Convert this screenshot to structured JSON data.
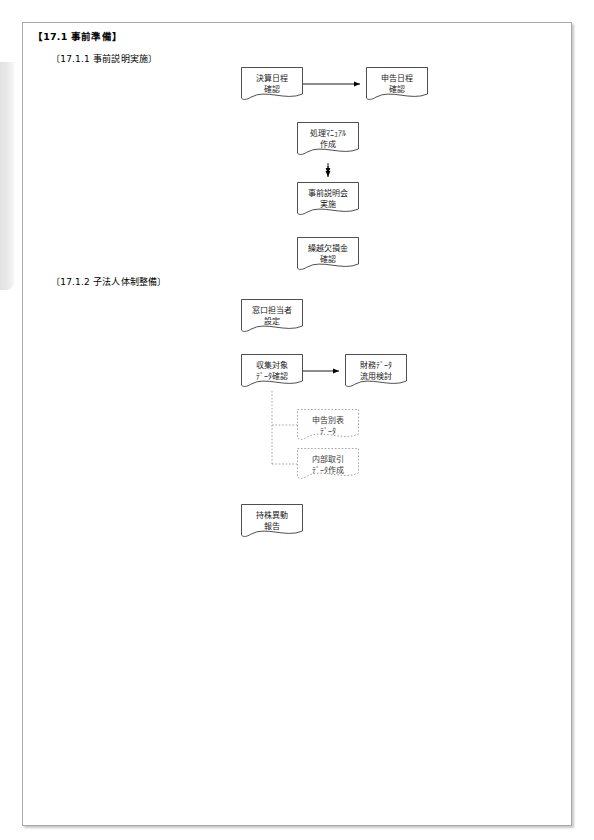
{
  "document": {
    "section_heading": "【17.1  事前準備】",
    "subsections": [
      {
        "id": "17.1.1",
        "label": "〔17.1.1  事前説明実施〕"
      },
      {
        "id": "17.1.2",
        "label": "〔17.1.2  子法人体制整備〕"
      }
    ]
  },
  "flowchart": {
    "type": "flowchart",
    "shape_style": "document",
    "nodes": [
      {
        "id": "n1",
        "line1": "決算日程",
        "line2": "確認",
        "x": 218,
        "y": 44,
        "w": 62,
        "h": 34,
        "style": "solid"
      },
      {
        "id": "n2",
        "line1": "申告日程",
        "line2": "確認",
        "x": 343,
        "y": 44,
        "w": 62,
        "h": 34,
        "style": "solid"
      },
      {
        "id": "n3",
        "line1": "処理ﾏﾆｭｱﾙ",
        "line2": "作成",
        "x": 274,
        "y": 99,
        "w": 62,
        "h": 34,
        "style": "solid"
      },
      {
        "id": "n4",
        "line1": "事前説明会",
        "line2": "実施",
        "x": 274,
        "y": 159,
        "w": 62,
        "h": 34,
        "style": "solid"
      },
      {
        "id": "n5",
        "line1": "繰越欠損金",
        "line2": "確認",
        "x": 274,
        "y": 214,
        "w": 62,
        "h": 34,
        "style": "solid"
      },
      {
        "id": "n6",
        "line1": "窓口担当者",
        "line2": "設定",
        "x": 218,
        "y": 276,
        "w": 62,
        "h": 34,
        "style": "solid"
      },
      {
        "id": "n7",
        "line1": "収集対象",
        "line2": "ﾃﾞｰﾀ確認",
        "x": 218,
        "y": 331,
        "w": 62,
        "h": 34,
        "style": "solid"
      },
      {
        "id": "n8",
        "line1": "財務ﾃﾞｰﾀ",
        "line2": "流用検討",
        "x": 322,
        "y": 331,
        "w": 62,
        "h": 34,
        "style": "solid"
      },
      {
        "id": "n9",
        "line1": "申告別表",
        "line2": "ﾃﾞｰﾀ",
        "x": 274,
        "y": 386,
        "w": 62,
        "h": 32,
        "style": "dotted"
      },
      {
        "id": "n10",
        "line1": "内部取引",
        "line2": "ﾃﾞｰﾀ作成",
        "x": 274,
        "y": 425,
        "w": 62,
        "h": 32,
        "style": "dotted"
      },
      {
        "id": "n11",
        "line1": "持株異動",
        "line2": "報告",
        "x": 218,
        "y": 481,
        "w": 62,
        "h": 34,
        "style": "solid"
      }
    ],
    "connectors": [
      {
        "from": "n1",
        "to": "n2",
        "kind": "arrow-right",
        "style": "solid"
      },
      {
        "from": "n3",
        "to": "n4",
        "kind": "arrow-both-v",
        "style": "solid"
      },
      {
        "from": "n7",
        "to": "n8",
        "kind": "arrow-right",
        "style": "solid"
      },
      {
        "from": "n7",
        "to": "n9",
        "kind": "elbow-down",
        "style": "dotted"
      },
      {
        "from": "n7",
        "to": "n10",
        "kind": "elbow-down",
        "style": "dotted"
      }
    ]
  },
  "colors": {
    "page_border": "#a9a9a9",
    "node_stroke": "#3b3b3b",
    "node_stroke_dotted": "#9b9b9b",
    "connector": "#000000",
    "connector_dotted": "#9b9b9b",
    "text": "#1a1a1a",
    "left_tab": "#e4e4e4",
    "page_background": "#ffffff"
  }
}
